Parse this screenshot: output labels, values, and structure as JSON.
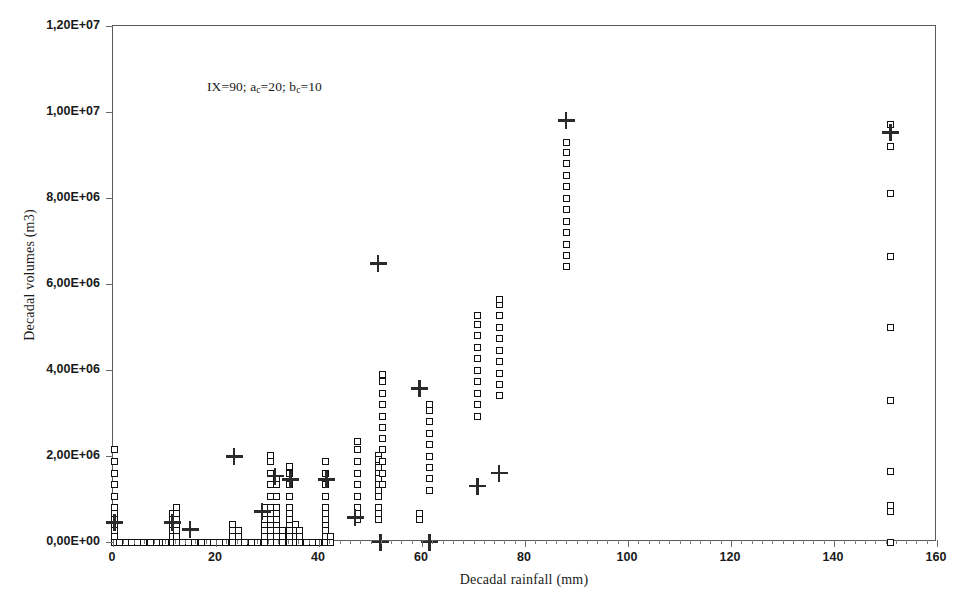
{
  "chart_data": {
    "type": "scatter",
    "title": "",
    "xlabel": "Decadal rainfall (mm)",
    "ylabel": "Decadal volumes (m3)",
    "annotation": "IX=90; a_c=20; b_c=10",
    "annotation_parts": {
      "prefix": "IX=90; a",
      "sub1": "c",
      "mid": "=20; b",
      "sub2": "c",
      "suffix": "=10"
    },
    "xlim": [
      0,
      160
    ],
    "ylim": [
      0,
      12000000
    ],
    "xticks": [
      0,
      20,
      40,
      60,
      80,
      100,
      120,
      140,
      160
    ],
    "xtick_labels": [
      "0",
      "20",
      "40",
      "60",
      "80",
      "100",
      "120",
      "140",
      "160"
    ],
    "xtick_minor_step": 2,
    "yticks": [
      0,
      2000000,
      4000000,
      6000000,
      8000000,
      10000000,
      12000000
    ],
    "ytick_labels": [
      "0,00E+00",
      "2,00E+06",
      "4,00E+06",
      "6,00E+06",
      "8,00E+06",
      "1,00E+07",
      "1,20E+07"
    ],
    "grid": false,
    "legend": null,
    "marker_colors": {
      "square_edge": "#111111",
      "square_fill": "#ffffff",
      "plus": "#2a2a2a",
      "axis": "#5a5a5a"
    },
    "series": [
      {
        "name": "observed-volumes",
        "marker": "open-square",
        "points": [
          [
            0.3,
            0
          ],
          [
            0.3,
            130000
          ],
          [
            0.3,
            270000
          ],
          [
            0.3,
            400000
          ],
          [
            0.3,
            530000
          ],
          [
            0.3,
            660000
          ],
          [
            0.3,
            800000
          ],
          [
            0.3,
            1060000
          ],
          [
            0.3,
            1330000
          ],
          [
            0.3,
            1600000
          ],
          [
            0.3,
            1870000
          ],
          [
            0.3,
            2140000
          ],
          [
            1.2,
            0
          ],
          [
            2.4,
            0
          ],
          [
            3.6,
            0
          ],
          [
            4.8,
            0
          ],
          [
            6.0,
            0
          ],
          [
            7.2,
            0
          ],
          [
            8.4,
            0
          ],
          [
            9.6,
            0
          ],
          [
            10.2,
            0
          ],
          [
            11.6,
            0
          ],
          [
            11.6,
            130000
          ],
          [
            11.6,
            270000
          ],
          [
            11.6,
            400000
          ],
          [
            11.6,
            530000
          ],
          [
            11.6,
            660000
          ],
          [
            12.3,
            0
          ],
          [
            12.3,
            130000
          ],
          [
            12.3,
            270000
          ],
          [
            12.3,
            400000
          ],
          [
            12.3,
            530000
          ],
          [
            12.3,
            660000
          ],
          [
            12.3,
            800000
          ],
          [
            13.5,
            0
          ],
          [
            14.7,
            0
          ],
          [
            15.9,
            0
          ],
          [
            17.1,
            0
          ],
          [
            18.3,
            0
          ],
          [
            19.5,
            0
          ],
          [
            20.7,
            0
          ],
          [
            21.9,
            0
          ],
          [
            23.2,
            0
          ],
          [
            23.2,
            130000
          ],
          [
            23.2,
            270000
          ],
          [
            23.2,
            400000
          ],
          [
            24.4,
            0
          ],
          [
            24.4,
            130000
          ],
          [
            24.4,
            270000
          ],
          [
            25.6,
            0
          ],
          [
            26.8,
            0
          ],
          [
            28.0,
            0
          ],
          [
            29.4,
            0
          ],
          [
            29.4,
            130000
          ],
          [
            29.4,
            270000
          ],
          [
            29.4,
            400000
          ],
          [
            29.4,
            530000
          ],
          [
            29.4,
            660000
          ],
          [
            29.4,
            800000
          ],
          [
            30.6,
            0
          ],
          [
            30.6,
            130000
          ],
          [
            30.6,
            270000
          ],
          [
            30.6,
            400000
          ],
          [
            30.6,
            530000
          ],
          [
            30.6,
            660000
          ],
          [
            30.6,
            800000
          ],
          [
            30.6,
            1060000
          ],
          [
            30.6,
            1330000
          ],
          [
            30.6,
            1600000
          ],
          [
            30.6,
            1870000
          ],
          [
            30.6,
            2020000
          ],
          [
            31.8,
            0
          ],
          [
            31.8,
            130000
          ],
          [
            31.8,
            270000
          ],
          [
            31.8,
            400000
          ],
          [
            31.8,
            530000
          ],
          [
            31.8,
            660000
          ],
          [
            31.8,
            800000
          ],
          [
            31.8,
            1060000
          ],
          [
            31.8,
            1330000
          ],
          [
            31.8,
            1470000
          ],
          [
            33.0,
            0
          ],
          [
            33.0,
            130000
          ],
          [
            33.0,
            270000
          ],
          [
            34.2,
            0
          ],
          [
            34.2,
            130000
          ],
          [
            34.2,
            270000
          ],
          [
            34.2,
            400000
          ],
          [
            34.2,
            530000
          ],
          [
            34.2,
            660000
          ],
          [
            34.2,
            800000
          ],
          [
            34.2,
            1060000
          ],
          [
            34.2,
            1330000
          ],
          [
            34.2,
            1600000
          ],
          [
            34.2,
            1750000
          ],
          [
            35.4,
            0
          ],
          [
            35.4,
            130000
          ],
          [
            35.4,
            270000
          ],
          [
            35.4,
            400000
          ],
          [
            36.3,
            0
          ],
          [
            36.3,
            130000
          ],
          [
            36.3,
            270000
          ],
          [
            37.5,
            0
          ],
          [
            38.7,
            0
          ],
          [
            39.9,
            0
          ],
          [
            41.3,
            0
          ],
          [
            41.3,
            130000
          ],
          [
            41.3,
            270000
          ],
          [
            41.3,
            400000
          ],
          [
            41.3,
            530000
          ],
          [
            41.3,
            660000
          ],
          [
            41.3,
            800000
          ],
          [
            41.3,
            1060000
          ],
          [
            41.3,
            1330000
          ],
          [
            41.3,
            1600000
          ],
          [
            41.3,
            1870000
          ],
          [
            42.2,
            0
          ],
          [
            42.2,
            130000
          ],
          [
            47.5,
            530000
          ],
          [
            47.5,
            660000
          ],
          [
            47.5,
            800000
          ],
          [
            47.5,
            1060000
          ],
          [
            47.5,
            1330000
          ],
          [
            47.5,
            1600000
          ],
          [
            47.5,
            1870000
          ],
          [
            47.5,
            2140000
          ],
          [
            47.5,
            2340000
          ],
          [
            51.5,
            530000
          ],
          [
            51.5,
            660000
          ],
          [
            51.5,
            800000
          ],
          [
            51.5,
            1060000
          ],
          [
            51.5,
            1330000
          ],
          [
            51.5,
            1600000
          ],
          [
            51.5,
            1870000
          ],
          [
            51.5,
            2020000
          ],
          [
            51.5,
            1200000
          ],
          [
            51.5,
            1470000
          ],
          [
            51.5,
            1730000
          ],
          [
            51.5,
            1930000
          ],
          [
            52.3,
            1330000
          ],
          [
            52.3,
            1600000
          ],
          [
            52.3,
            1870000
          ],
          [
            52.3,
            2140000
          ],
          [
            52.3,
            2400000
          ],
          [
            52.3,
            2670000
          ],
          [
            52.3,
            2930000
          ],
          [
            52.3,
            3200000
          ],
          [
            52.3,
            3460000
          ],
          [
            52.3,
            3730000
          ],
          [
            52.3,
            3900000
          ],
          [
            59.5,
            530000
          ],
          [
            59.5,
            660000
          ],
          [
            61.5,
            1200000
          ],
          [
            61.5,
            1470000
          ],
          [
            61.5,
            1730000
          ],
          [
            61.5,
            2000000
          ],
          [
            61.5,
            2270000
          ],
          [
            61.5,
            2530000
          ],
          [
            61.5,
            2800000
          ],
          [
            61.5,
            3060000
          ],
          [
            61.5,
            3200000
          ],
          [
            70.8,
            2930000
          ],
          [
            70.8,
            3200000
          ],
          [
            70.8,
            3460000
          ],
          [
            70.8,
            3730000
          ],
          [
            70.8,
            4000000
          ],
          [
            70.8,
            4260000
          ],
          [
            70.8,
            4530000
          ],
          [
            70.8,
            4800000
          ],
          [
            70.8,
            5060000
          ],
          [
            70.8,
            5270000
          ],
          [
            75.0,
            3400000
          ],
          [
            75.0,
            3670000
          ],
          [
            75.0,
            3930000
          ],
          [
            75.0,
            4200000
          ],
          [
            75.0,
            4460000
          ],
          [
            75.0,
            4730000
          ],
          [
            75.0,
            5000000
          ],
          [
            75.0,
            5260000
          ],
          [
            75.0,
            5530000
          ],
          [
            75.0,
            5650000
          ],
          [
            88.0,
            6400000
          ],
          [
            88.0,
            6660000
          ],
          [
            88.0,
            6930000
          ],
          [
            88.0,
            7200000
          ],
          [
            88.0,
            7460000
          ],
          [
            88.0,
            7730000
          ],
          [
            88.0,
            8000000
          ],
          [
            88.0,
            8260000
          ],
          [
            88.0,
            8530000
          ],
          [
            88.0,
            8800000
          ],
          [
            88.0,
            9060000
          ],
          [
            88.0,
            9300000
          ],
          [
            151.0,
            0
          ],
          [
            151.0,
            700000
          ],
          [
            151.0,
            850000
          ],
          [
            151.0,
            1650000
          ],
          [
            151.0,
            3300000
          ],
          [
            151.0,
            5000000
          ],
          [
            151.0,
            6650000
          ],
          [
            151.0,
            8100000
          ],
          [
            151.0,
            9200000
          ],
          [
            151.0,
            9700000
          ]
        ]
      },
      {
        "name": "simulated-volumes",
        "marker": "plus",
        "points": [
          [
            0.3,
            450000
          ],
          [
            11.6,
            450000
          ],
          [
            15.0,
            280000
          ],
          [
            23.5,
            1980000
          ],
          [
            29.0,
            700000
          ],
          [
            31.5,
            1530000
          ],
          [
            34.5,
            1450000
          ],
          [
            41.5,
            1450000
          ],
          [
            47.0,
            560000
          ],
          [
            51.5,
            6470000
          ],
          [
            52.0,
            0
          ],
          [
            59.5,
            3560000
          ],
          [
            61.5,
            0
          ],
          [
            70.8,
            1300000
          ],
          [
            75.0,
            1600000
          ],
          [
            88.0,
            9800000
          ],
          [
            151.0,
            9520000
          ]
        ]
      }
    ]
  }
}
